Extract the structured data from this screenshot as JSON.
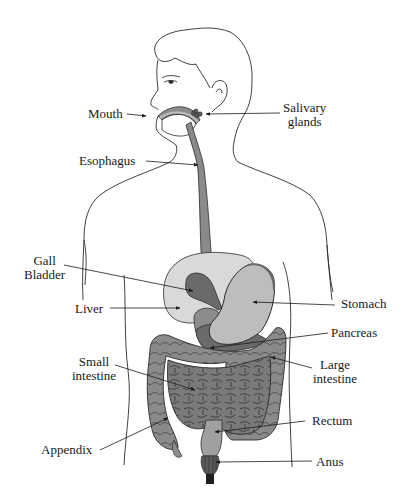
{
  "colors": {
    "outline": "#2b2b2b",
    "organ_dark": "#6a6a6a",
    "organ_mid": "#8c8c8c",
    "organ_light": "#bdbdbd",
    "liver": "#d9d9d9",
    "label": "#1a1a1a"
  },
  "labels": {
    "mouth": "Mouth",
    "salivary_1": "Salivary",
    "salivary_2": "glands",
    "esophagus": "Esophagus",
    "gall_1": "Gall",
    "gall_2": "Bladder",
    "liver": "Liver",
    "stomach": "Stomach",
    "pancreas": "Pancreas",
    "small_1": "Small",
    "small_2": "intestine",
    "large_1": "Large",
    "large_2": "intestine",
    "rectum": "Rectum",
    "appendix": "Appendix",
    "anus": "Anus"
  }
}
